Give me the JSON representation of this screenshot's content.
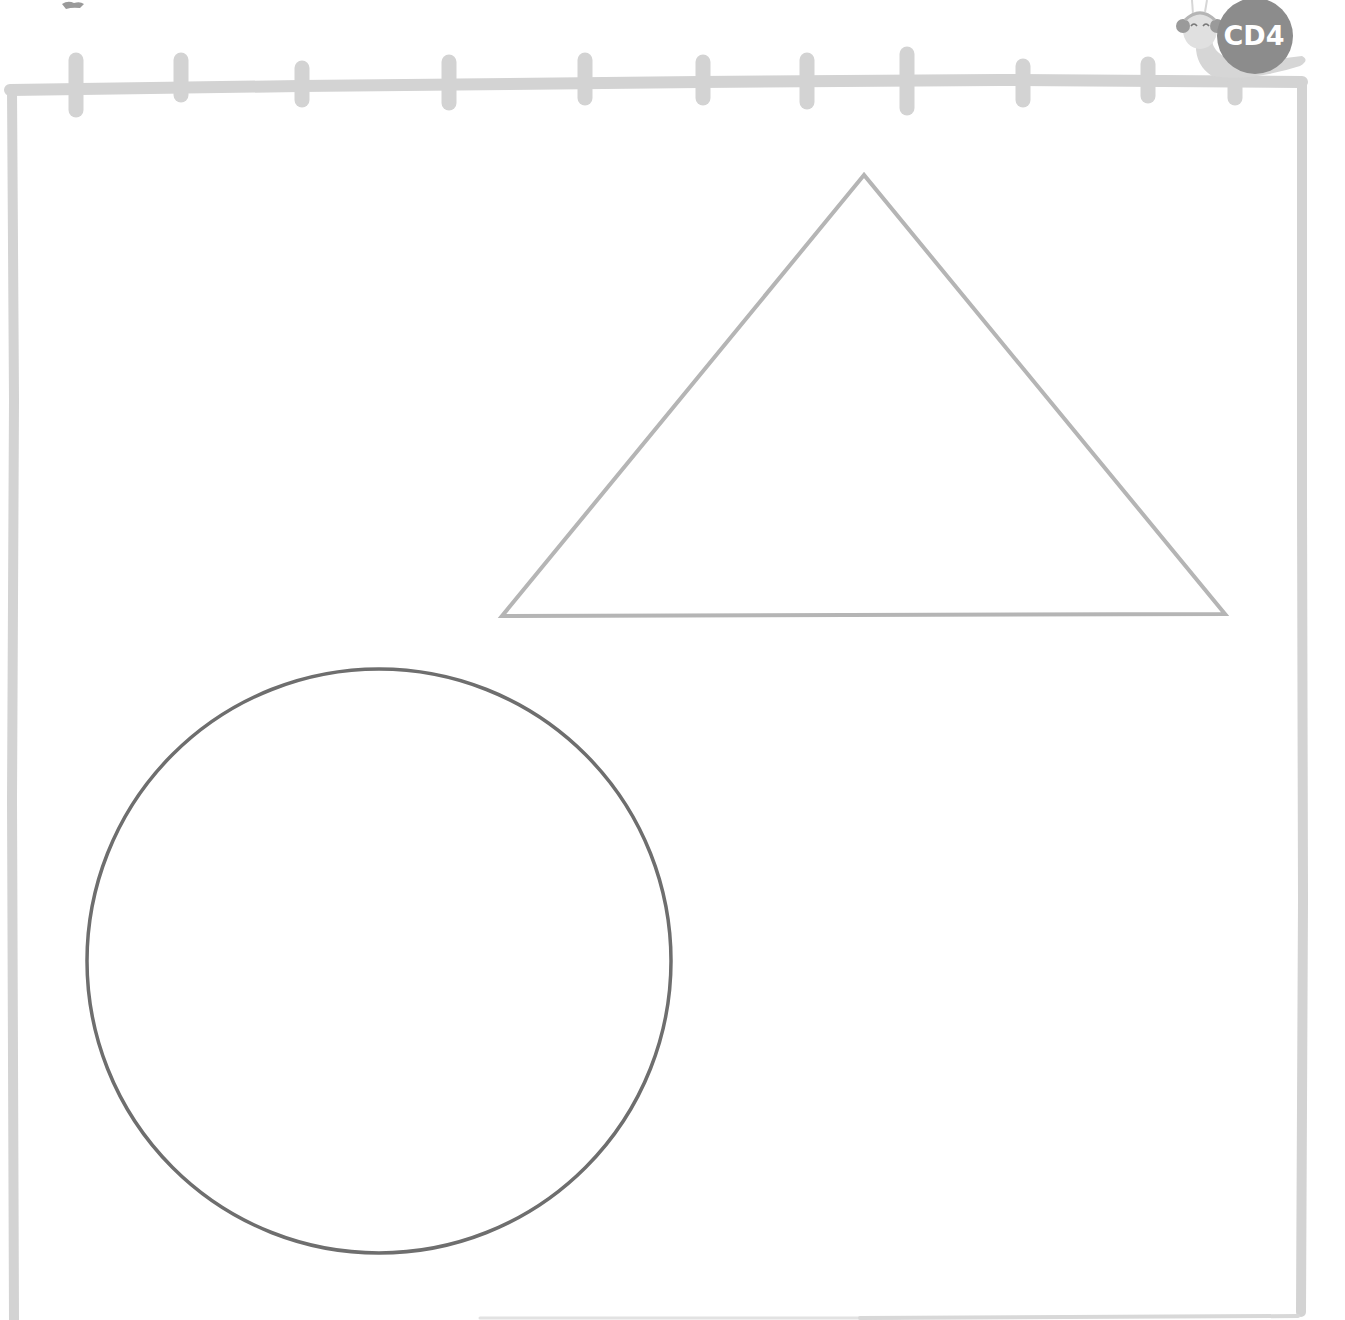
{
  "worksheet": {
    "badge": {
      "label": "CD4",
      "mascot": "snail-with-headphones",
      "shell_color": "#8c8c8c",
      "body_color": "#d6d6d6"
    },
    "frame": {
      "style": "notebook-with-binder-rings",
      "stroke_color": "#d3d3d3",
      "ring_count": 11
    },
    "shapes": [
      {
        "type": "triangle",
        "stroke_color": "#b5b5b5",
        "points": [
          [
            864,
            175
          ],
          [
            502,
            616
          ],
          [
            1225,
            614
          ]
        ]
      },
      {
        "type": "circle",
        "stroke_color": "#6e6e6e",
        "center": [
          379,
          961
        ],
        "radius": 292
      }
    ]
  }
}
